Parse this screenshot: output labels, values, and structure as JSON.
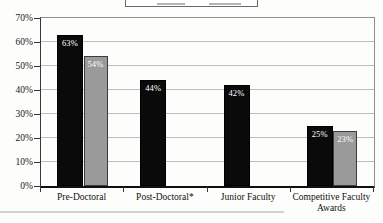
{
  "chart_data": {
    "type": "bar",
    "title": "",
    "xlabel": "",
    "ylabel": "",
    "categories": [
      "Pre-Doctoral",
      "Post-Doctoral*",
      "Junior Faculty",
      "Competitive Faculty Awards"
    ],
    "series": [
      {
        "name": "black-series",
        "color": "#0a0a0a",
        "values": [
          63,
          44,
          42,
          25
        ],
        "value_labels": [
          "63%",
          "44%",
          "42%",
          "25%"
        ]
      },
      {
        "name": "gray-series",
        "color": "#9a9a9a",
        "values": [
          54,
          null,
          null,
          23
        ],
        "value_labels": [
          "54%",
          null,
          null,
          "23%"
        ]
      }
    ],
    "value_label_color": "#ffffff",
    "ylim": [
      0,
      70
    ],
    "y_tick_step": 10,
    "y_tick_labels": [
      "0%",
      "10%",
      "20%",
      "30%",
      "40%",
      "50%",
      "60%",
      "70%"
    ],
    "grid": true,
    "legend_position": "top",
    "legend_cropped_out_of_frame": true,
    "colors": {
      "gridline": "#bdbdbd",
      "axis": "#101010",
      "plot_border": "#8f8f8f",
      "background": "#fdfdfc",
      "scan_artifact": "#d2d2d2"
    }
  }
}
